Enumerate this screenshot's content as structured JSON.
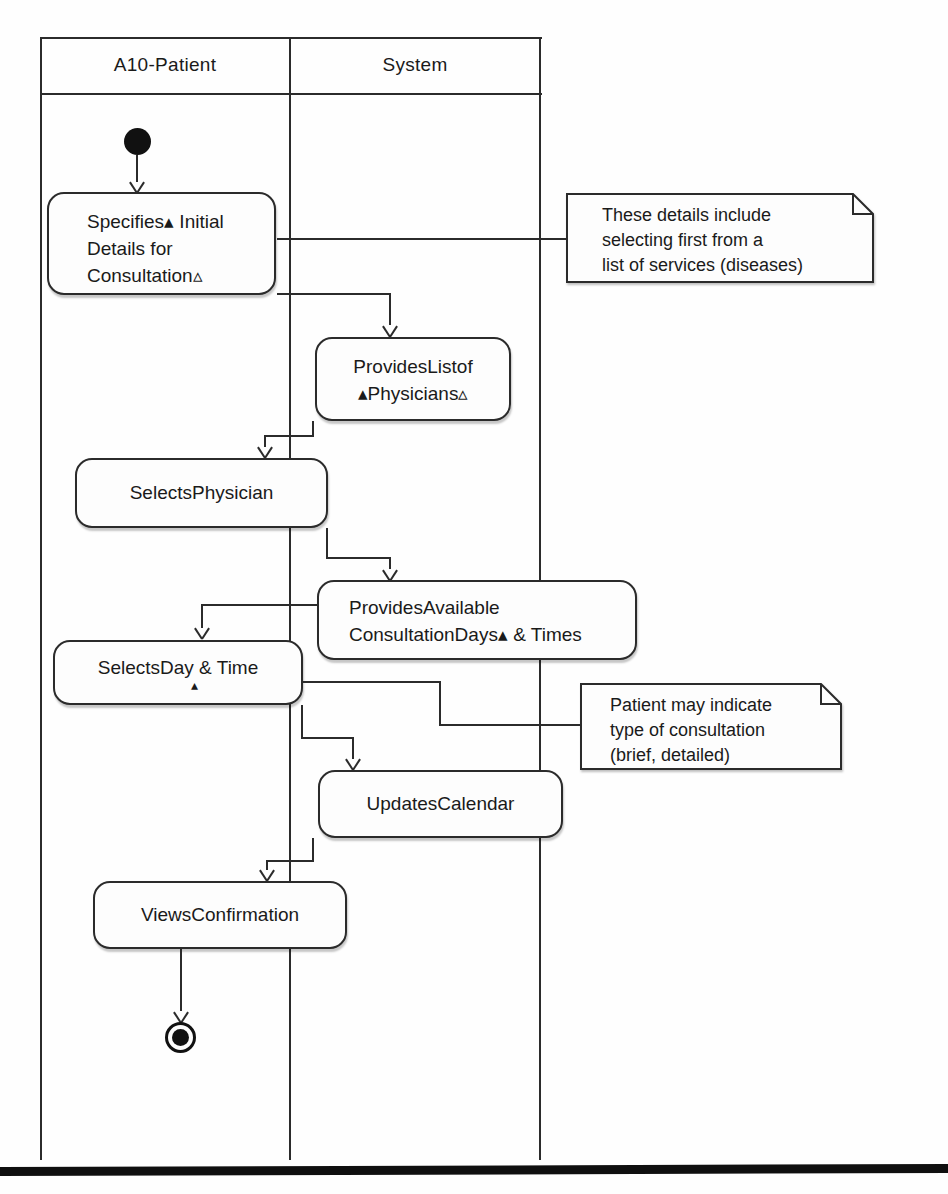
{
  "lanes": {
    "patient": "A10-Patient",
    "system": "System"
  },
  "activities": {
    "specifies": {
      "l1": "Specifies▴ Initial",
      "l2": "Details for",
      "l3": "Consultation▵"
    },
    "provides_list": {
      "l1": "ProvidesListof",
      "l2": "▴Physicians▵"
    },
    "selects_physician": {
      "l1": "SelectsPhysician"
    },
    "provides_available": {
      "l1": "ProvidesAvailable",
      "l2": "ConsultationDays▴ & Times"
    },
    "selects_day": {
      "l1": "SelectsDay & Time",
      "marker": "▴"
    },
    "updates_calendar": {
      "l1": "UpdatesCalendar"
    },
    "views_confirmation": {
      "l1": "ViewsConfirmation"
    }
  },
  "notes": {
    "note1": {
      "l1": "These details include",
      "l2": "selecting first from a",
      "l3": "list of services (diseases)"
    },
    "note2": {
      "l1": "Patient may indicate",
      "l2": "type of consultation",
      "l3": "(brief, detailed)"
    }
  },
  "colors": {
    "line": "#2b2b2b",
    "text": "#1a1a1a",
    "box_fill": "#fdfdfd",
    "bottom_bar": "#0f0f0f"
  }
}
